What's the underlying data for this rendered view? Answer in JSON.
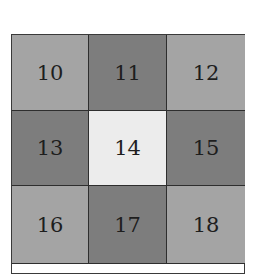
{
  "grid": {
    "rows": 3,
    "cols": 3,
    "cells": [
      {
        "label": "10",
        "shade": "light",
        "color": "#a4a4a4"
      },
      {
        "label": "11",
        "shade": "dark",
        "color": "#7d7d7d"
      },
      {
        "label": "12",
        "shade": "light",
        "color": "#a4a4a4"
      },
      {
        "label": "13",
        "shade": "dark",
        "color": "#7d7d7d"
      },
      {
        "label": "14",
        "shade": "center",
        "color": "#ececec"
      },
      {
        "label": "15",
        "shade": "dark",
        "color": "#7d7d7d"
      },
      {
        "label": "16",
        "shade": "light",
        "color": "#a4a4a4"
      },
      {
        "label": "17",
        "shade": "dark",
        "color": "#7d7d7d"
      },
      {
        "label": "18",
        "shade": "light",
        "color": "#a4a4a4"
      }
    ]
  }
}
